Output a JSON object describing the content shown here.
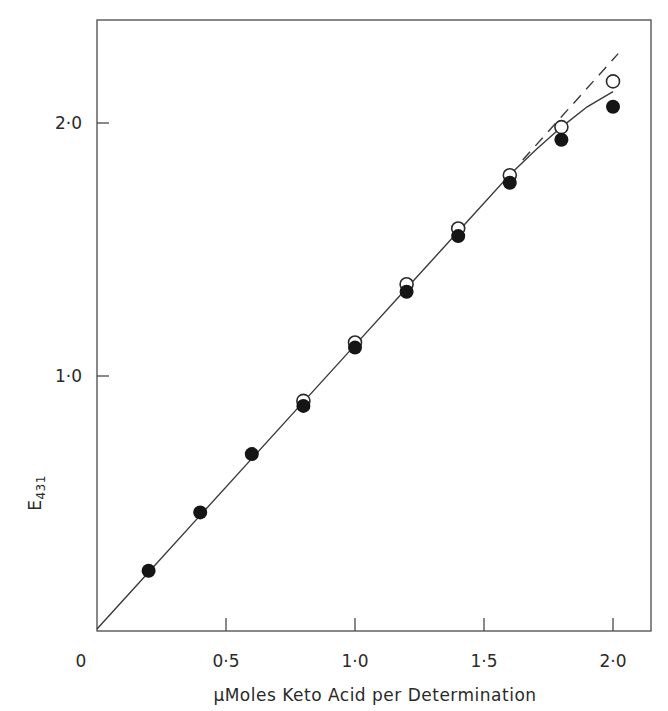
{
  "chart_data": {
    "type": "scatter",
    "title": "",
    "xlabel": "µMoles Keto Acid per Determination",
    "ylabel": "E431",
    "ylabel_main": "E",
    "ylabel_subscript": "431",
    "xlim": [
      0,
      2.15
    ],
    "ylim": [
      0,
      2.4
    ],
    "grid": false,
    "legend": null,
    "x_ticks": [
      0.5,
      1.0,
      1.5,
      2.0
    ],
    "y_ticks": [
      1.0,
      2.0
    ],
    "x_tick_labels": [
      "0",
      "0·5",
      "1·0",
      "1·5",
      "2·0"
    ],
    "y_tick_labels": [
      "1·0",
      "2·0"
    ],
    "origin_label": "0",
    "series": [
      {
        "name": "open circles",
        "marker": "open-circle",
        "x": [
          0.8,
          1.0,
          1.2,
          1.4,
          1.6,
          1.8,
          2.0
        ],
        "y": [
          0.9,
          1.13,
          1.36,
          1.58,
          1.79,
          1.98,
          2.16
        ]
      },
      {
        "name": "filled circles",
        "marker": "filled-circle",
        "x": [
          0.2,
          0.4,
          0.6,
          0.8,
          1.0,
          1.2,
          1.4,
          1.6,
          1.8,
          2.0
        ],
        "y": [
          0.23,
          0.46,
          0.69,
          0.88,
          1.11,
          1.33,
          1.55,
          1.76,
          1.93,
          2.06
        ]
      }
    ],
    "lines": [
      {
        "name": "fitted line",
        "style": "solid",
        "x": [
          0,
          0.2,
          0.4,
          0.6,
          0.8,
          1.0,
          1.2,
          1.4,
          1.6,
          1.7,
          1.8,
          1.9,
          2.0
        ],
        "y": [
          0,
          0.224,
          0.448,
          0.672,
          0.896,
          1.12,
          1.344,
          1.568,
          1.792,
          1.89,
          1.98,
          2.06,
          2.12
        ]
      },
      {
        "name": "linear extrapolation",
        "style": "dashed",
        "x": [
          1.65,
          2.02
        ],
        "y": [
          1.85,
          2.27
        ]
      }
    ]
  }
}
